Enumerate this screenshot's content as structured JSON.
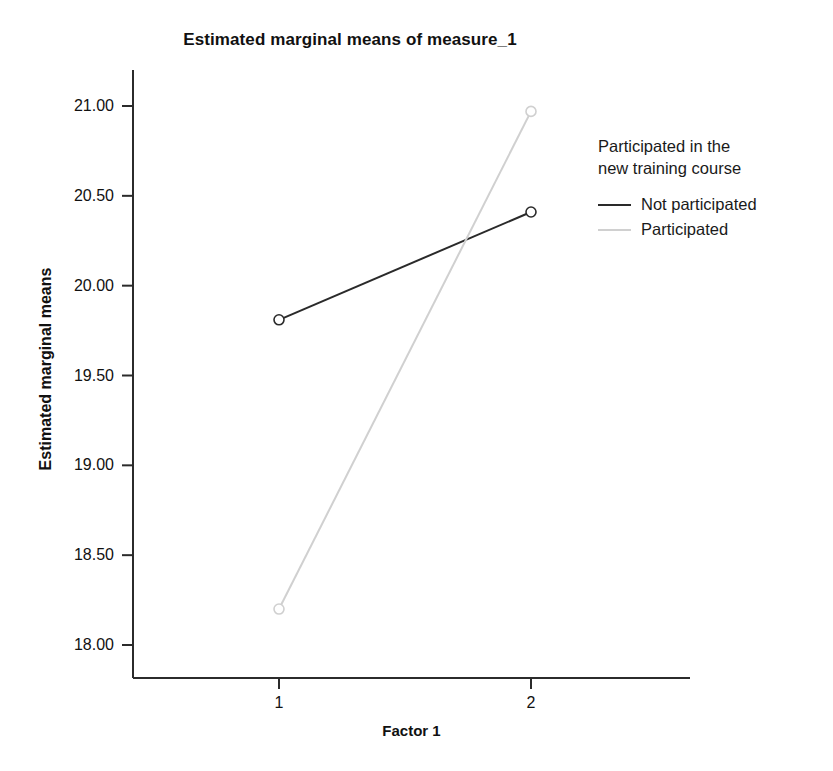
{
  "chart_data": {
    "type": "line",
    "title": "Estimated marginal means of measure_1",
    "xlabel": "Factor 1",
    "ylabel": "Estimated marginal means",
    "categories": [
      "1",
      "2"
    ],
    "x": [
      1,
      2
    ],
    "xtick_labels": [
      "1",
      "2"
    ],
    "ytick_labels": [
      "18.00",
      "18.50",
      "19.00",
      "19.50",
      "20.00",
      "20.50",
      "21.00"
    ],
    "yticks": [
      18.0,
      18.5,
      19.0,
      19.5,
      20.0,
      20.5,
      21.0
    ],
    "ylim": [
      17.85,
      21.15
    ],
    "grid": false,
    "legend_position": "right",
    "legend_title": "Participated in the\nnew training course",
    "marker": "open-circle",
    "series": [
      {
        "name": "Not participated",
        "values": [
          19.81,
          20.41
        ],
        "color": "#2a2a2a",
        "linestyle": "solid",
        "linewidth": 2
      },
      {
        "name": "Participated",
        "values": [
          18.2,
          20.97
        ],
        "color": "#d0d0d0",
        "linestyle": "solid",
        "linewidth": 2
      }
    ]
  },
  "axis": {
    "line_color": "#2b2b2b"
  }
}
